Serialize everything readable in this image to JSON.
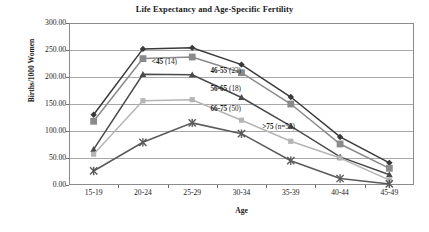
{
  "chart_data": {
    "type": "line",
    "title": "Life Expectancy and Age-Specific Fertility",
    "xlabel": "Age",
    "ylabel": "Births/1000 Women",
    "categories": [
      "15-19",
      "20-24",
      "25-29",
      "30-34",
      "35-39",
      "40-44",
      "45-49"
    ],
    "ylim": [
      0,
      300
    ],
    "ytick_values": [
      0,
      50,
      100,
      150,
      200,
      250,
      300
    ],
    "ytick_labels": [
      "0.00",
      "50.00",
      "100.00",
      "150.00",
      "200.00",
      "250.00",
      "300.00"
    ],
    "grid": true,
    "legend": "inline-annotations",
    "series": [
      {
        "name": "<45 (14)",
        "label_bold": "<45",
        "label_rest": " (14)",
        "marker": "diamond",
        "color": "#3a3a3a",
        "values": [
          130,
          252,
          254,
          223,
          163,
          89,
          41
        ]
      },
      {
        "name": "46-55 (23)",
        "label_bold": "46-55",
        "label_rest": " (23)",
        "marker": "square",
        "color": "#8a8a8a",
        "values": [
          118,
          234,
          237,
          208,
          150,
          76,
          31
        ]
      },
      {
        "name": "56-65 (18)",
        "label_bold": "56-65",
        "label_rest": " (18)",
        "marker": "triangle",
        "color": "#4a4a4a",
        "values": [
          66,
          205,
          204,
          162,
          109,
          52,
          19
        ]
      },
      {
        "name": "66-75 (50)",
        "label_bold": "66-75",
        "label_rest": " (50)",
        "marker": "small-square",
        "color": "#b5b5b5",
        "values": [
          57,
          156,
          158,
          120,
          81,
          50,
          9
        ]
      },
      {
        "name": ">75 (n=53)",
        "label_bold": ">75",
        "label_rest": " (n=53)",
        "marker": "cross",
        "color": "#5a5a5a",
        "values": [
          26,
          79,
          115,
          95,
          45,
          12,
          2
        ]
      }
    ],
    "annotations": [
      {
        "text": "<45 (14)",
        "x_pct": 24,
        "y_value": 228
      },
      {
        "text": "46-55 (23)",
        "x_pct": 41,
        "y_value": 212
      },
      {
        "text": "56-65 (18)",
        "x_pct": 41,
        "y_value": 178
      },
      {
        "text": "66-75 (50)",
        "x_pct": 41,
        "y_value": 140
      },
      {
        "text": ">75 (n=53)",
        "x_pct": 56,
        "y_value": 108
      }
    ]
  }
}
